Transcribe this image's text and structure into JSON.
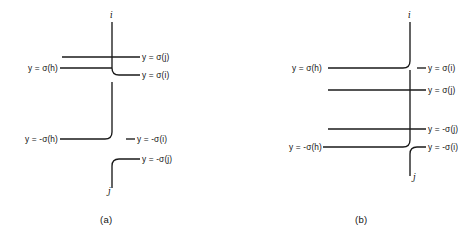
{
  "figure": {
    "width": 421,
    "height": 244,
    "background": "#ffffff",
    "ink": "#1a1a1a"
  },
  "panels": [
    {
      "id": "a",
      "caption": "(a)",
      "nodes": [
        {
          "name": "node-i",
          "label": "i"
        },
        {
          "name": "node-j",
          "label": "j"
        }
      ],
      "labels": [
        {
          "name": "label-y-sigma-j",
          "text": "y = σ(j)",
          "side": "right"
        },
        {
          "name": "label-y-sigma-h",
          "text": "y = σ(h)",
          "side": "left"
        },
        {
          "name": "label-y-sigma-i",
          "text": "y = σ(i)",
          "side": "right"
        },
        {
          "name": "label-y-neg-sigma-h",
          "text": "y = -σ(h)",
          "side": "left"
        },
        {
          "name": "label-y-neg-sigma-i",
          "text": "y = -σ(i)",
          "side": "right"
        },
        {
          "name": "label-y-neg-sigma-j",
          "text": "y = -σ(j)",
          "side": "right"
        }
      ]
    },
    {
      "id": "b",
      "caption": "(b)",
      "nodes": [
        {
          "name": "node-i",
          "label": "i"
        },
        {
          "name": "node-j",
          "label": "j"
        }
      ],
      "labels": [
        {
          "name": "label-y-sigma-h",
          "text": "y = σ(h)",
          "side": "left"
        },
        {
          "name": "label-y-sigma-i",
          "text": "y = σ(i)",
          "side": "right"
        },
        {
          "name": "label-y-sigma-j",
          "text": "y = σ(j)",
          "side": "right"
        },
        {
          "name": "label-y-neg-sigma-j",
          "text": "y = -σ(j)",
          "side": "right"
        },
        {
          "name": "label-y-neg-sigma-h",
          "text": "y = -σ(h)",
          "side": "left"
        },
        {
          "name": "label-y-neg-sigma-i",
          "text": "y = -σ(i)",
          "side": "right"
        }
      ]
    }
  ]
}
